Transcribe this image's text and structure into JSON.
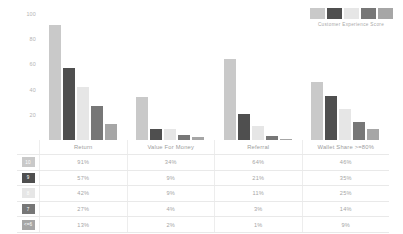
{
  "legend": {
    "caption": "Customer Experience Score",
    "swatches": [
      "#c9c9c9",
      "#4f4f4f",
      "#e6e6e6",
      "#777777",
      "#a6a6a6"
    ]
  },
  "chart_data": {
    "type": "bar",
    "title": "",
    "xlabel": "",
    "ylabel": "",
    "ylim": [
      0,
      100
    ],
    "yticks": [
      100,
      80,
      60,
      40,
      20
    ],
    "grid": false,
    "legend_position": "top-right",
    "legend_title": "Customer Experience Score",
    "categories": [
      "Return",
      "Value For Money",
      "Referral",
      "Wallet Share >=80%"
    ],
    "series": [
      {
        "name": "10",
        "color": "#c9c9c9",
        "values": [
          91,
          34,
          64,
          46
        ]
      },
      {
        "name": "9",
        "color": "#4f4f4f",
        "values": [
          57,
          9,
          21,
          35
        ]
      },
      {
        "name": "8",
        "color": "#e6e6e6",
        "values": [
          42,
          9,
          11,
          25
        ]
      },
      {
        "name": "7",
        "color": "#777777",
        "values": [
          27,
          4,
          3,
          14
        ]
      },
      {
        "name": "<=6",
        "color": "#a6a6a6",
        "values": [
          13,
          2,
          1,
          9
        ]
      }
    ]
  },
  "table": {
    "row_header_label": "",
    "columns": [
      "Return",
      "Value For Money",
      "Referral",
      "Wallet Share >=80%"
    ],
    "rows": [
      {
        "badge": "10",
        "badge_color": "#c9c9c9",
        "values": [
          "91%",
          "34%",
          "64%",
          "46%"
        ]
      },
      {
        "badge": "9",
        "badge_color": "#4f4f4f",
        "values": [
          "57%",
          "9%",
          "21%",
          "35%"
        ]
      },
      {
        "badge": "8",
        "badge_color": "#e6e6e6",
        "values": [
          "42%",
          "9%",
          "11%",
          "25%"
        ]
      },
      {
        "badge": "7",
        "badge_color": "#777777",
        "values": [
          "27%",
          "4%",
          "3%",
          "14%"
        ]
      },
      {
        "badge": "<=6",
        "badge_color": "#a6a6a6",
        "values": [
          "13%",
          "2%",
          "1%",
          "9%"
        ]
      }
    ]
  }
}
